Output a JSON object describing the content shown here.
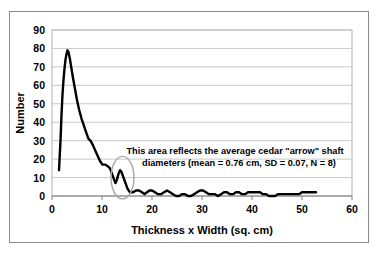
{
  "chart_data": {
    "type": "line",
    "title": "",
    "xlabel": "Thickness x Width (sq. cm)",
    "ylabel": "Number",
    "xlim": [
      0,
      60
    ],
    "ylim": [
      0,
      90
    ],
    "xticks": [
      0,
      10,
      20,
      30,
      40,
      50,
      60
    ],
    "yticks": [
      0,
      10,
      20,
      30,
      40,
      50,
      60,
      70,
      80,
      90
    ],
    "grid": "horizontal",
    "legend": "none",
    "series": [
      {
        "name": "Number",
        "color": "#000000",
        "points": [
          [
            1.4,
            14
          ],
          [
            1.7,
            30
          ],
          [
            1.9,
            44
          ],
          [
            2.1,
            55
          ],
          [
            2.3,
            63
          ],
          [
            2.5,
            69
          ],
          [
            2.7,
            74
          ],
          [
            2.9,
            77
          ],
          [
            3.1,
            79
          ],
          [
            3.3,
            78
          ],
          [
            3.6,
            74
          ],
          [
            3.9,
            69
          ],
          [
            4.2,
            64
          ],
          [
            4.6,
            58
          ],
          [
            5.0,
            52
          ],
          [
            5.4,
            47
          ],
          [
            5.9,
            42
          ],
          [
            6.4,
            38
          ],
          [
            6.9,
            34
          ],
          [
            7.3,
            31
          ],
          [
            7.7,
            30
          ],
          [
            8.1,
            28
          ],
          [
            8.6,
            25
          ],
          [
            9.1,
            22
          ],
          [
            9.6,
            19
          ],
          [
            10.1,
            17
          ],
          [
            10.7,
            17
          ],
          [
            11.2,
            16
          ],
          [
            11.6,
            15
          ],
          [
            12.0,
            12
          ],
          [
            12.4,
            9
          ],
          [
            12.7,
            7
          ],
          [
            13.0,
            9
          ],
          [
            13.3,
            12
          ],
          [
            13.6,
            14
          ],
          [
            13.9,
            13
          ],
          [
            14.3,
            10
          ],
          [
            14.7,
            7
          ],
          [
            15.1,
            4
          ],
          [
            15.6,
            2
          ],
          [
            16.2,
            2
          ],
          [
            16.8,
            3
          ],
          [
            17.4,
            3
          ],
          [
            18.0,
            2
          ],
          [
            18.5,
            1
          ],
          [
            19.0,
            2
          ],
          [
            19.5,
            3
          ],
          [
            20.0,
            3
          ],
          [
            20.6,
            2
          ],
          [
            21.2,
            1
          ],
          [
            21.8,
            1
          ],
          [
            22.4,
            2
          ],
          [
            23.0,
            3
          ],
          [
            23.6,
            2
          ],
          [
            24.2,
            1
          ],
          [
            24.8,
            0
          ],
          [
            25.4,
            0
          ],
          [
            26.0,
            1
          ],
          [
            26.6,
            1
          ],
          [
            27.2,
            0
          ],
          [
            27.8,
            0
          ],
          [
            28.4,
            1
          ],
          [
            29.0,
            2
          ],
          [
            29.6,
            3
          ],
          [
            30.2,
            3
          ],
          [
            30.8,
            2
          ],
          [
            31.4,
            1
          ],
          [
            32.0,
            1
          ],
          [
            32.6,
            1
          ],
          [
            33.2,
            0
          ],
          [
            33.8,
            1
          ],
          [
            34.4,
            2
          ],
          [
            35.0,
            2
          ],
          [
            35.6,
            1
          ],
          [
            36.2,
            1
          ],
          [
            36.8,
            2
          ],
          [
            37.4,
            2
          ],
          [
            38.0,
            1
          ],
          [
            38.6,
            1
          ],
          [
            39.2,
            2
          ],
          [
            39.8,
            2
          ],
          [
            40.4,
            2
          ],
          [
            41.0,
            2
          ],
          [
            41.6,
            2
          ],
          [
            42.2,
            1
          ],
          [
            42.8,
            1
          ],
          [
            43.4,
            0
          ],
          [
            44.0,
            0
          ],
          [
            44.6,
            0
          ],
          [
            45.2,
            1
          ],
          [
            45.8,
            1
          ],
          [
            46.4,
            1
          ],
          [
            47.0,
            1
          ],
          [
            47.6,
            1
          ],
          [
            48.2,
            1
          ],
          [
            48.8,
            1
          ],
          [
            49.4,
            1
          ],
          [
            50.0,
            2
          ],
          [
            50.6,
            2
          ],
          [
            51.2,
            2
          ],
          [
            51.8,
            2
          ],
          [
            52.4,
            2
          ],
          [
            52.8,
            2
          ]
        ]
      }
    ],
    "annotations": [
      {
        "name": "cedar-arrow-shaft-note",
        "line1": "This area reflects  the average cedar \"arrow\" shaft",
        "line2": "diameters  (mean = 0.76 cm,  SD = 0.07, N = 8)"
      },
      {
        "name": "highlight-ellipse",
        "shape": "ellipse",
        "color": "#a6a6a6",
        "center_x": 14.1,
        "center_y": 10,
        "radius_x": 2.3,
        "radius_y": 11.5
      }
    ]
  }
}
